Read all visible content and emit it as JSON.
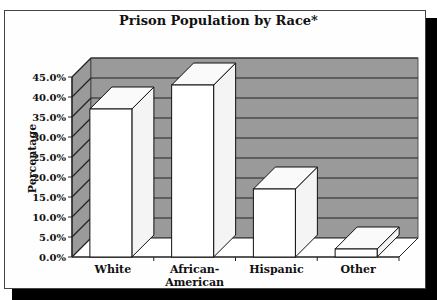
{
  "chart_data": {
    "type": "bar",
    "title": "Prison Population by Race*",
    "xlabel": "",
    "ylabel": "Percentage",
    "categories": [
      "White",
      "African-American",
      "Hispanic",
      "Other"
    ],
    "category_labels": [
      [
        "White"
      ],
      [
        "African-",
        "American"
      ],
      [
        "Hispanic"
      ],
      [
        "Other"
      ]
    ],
    "values": [
      37,
      43,
      17,
      2
    ],
    "ylim": [
      0,
      45
    ],
    "yticks": [
      "0.0%",
      "5.0%",
      "10.0%",
      "15.0%",
      "20.0%",
      "25.0%",
      "30.0%",
      "35.0%",
      "40.0%",
      "45.0%"
    ],
    "grid": true,
    "style": "3d-column",
    "legend": null,
    "colors": {
      "bar_face": "#ffffff",
      "wall": "#9a9a9a",
      "grid": "#222222",
      "shadow": "#000000"
    }
  }
}
